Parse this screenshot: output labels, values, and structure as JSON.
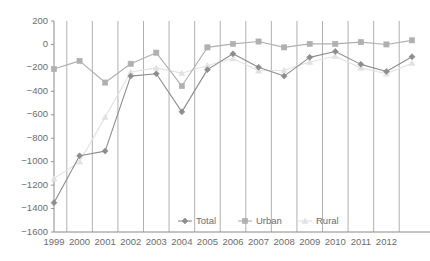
{
  "chart_data": {
    "type": "line",
    "title": "",
    "subtitle": "",
    "xlabel": "",
    "ylabel": "",
    "x": [
      1999,
      2000,
      2001,
      2002,
      2003,
      2004,
      2005,
      2006,
      2007,
      2008,
      2009,
      2010,
      2011,
      2012,
      2013
    ],
    "categories": [
      "1999",
      "2000",
      "2001",
      "2002",
      "2003",
      "2004",
      "2005",
      "2006",
      "2007",
      "2008",
      "2009",
      "2010",
      "2011",
      "2012",
      ""
    ],
    "xtick_labels": [
      "1999",
      "2000",
      "2001",
      "2002",
      "2003",
      "2004",
      "2005",
      "2006",
      "2007",
      "2008",
      "2009",
      "2010",
      "2011",
      "2012"
    ],
    "ytick_labels": [
      "200",
      "0",
      "-200",
      "-400",
      "-600",
      "-800",
      "-1000",
      "-1200",
      "-1400",
      "-1600"
    ],
    "yticks": [
      200,
      0,
      -200,
      -400,
      -600,
      -800,
      -1000,
      -1200,
      -1400,
      -1600
    ],
    "ylim": [
      -1600,
      200
    ],
    "xlim": [
      1999,
      2013
    ],
    "grid": "vertical-only",
    "legend_position": "inside-bottom-center",
    "series": [
      {
        "name": "Total",
        "color": "#8d8d8d",
        "marker": "diamond",
        "values": [
          -1350,
          -950,
          -910,
          -270,
          -250,
          -575,
          -215,
          -80,
          -195,
          -270,
          -110,
          -60,
          -170,
          -230,
          -105
        ]
      },
      {
        "name": "Urban",
        "color": "#b0b0b0",
        "marker": "square",
        "values": [
          -210,
          -140,
          -325,
          -165,
          -70,
          -355,
          -25,
          5,
          25,
          -25,
          5,
          5,
          20,
          0,
          35
        ]
      },
      {
        "name": "Rural",
        "color": "#e2e2e2",
        "marker": "triangle",
        "values": [
          -1145,
          -1000,
          -620,
          -235,
          -200,
          -245,
          -180,
          -120,
          -225,
          -220,
          -150,
          -100,
          -200,
          -250,
          -160
        ]
      }
    ]
  },
  "legend": {
    "items": [
      {
        "label": "Total"
      },
      {
        "label": "Urban"
      },
      {
        "label": "Rural"
      }
    ]
  },
  "colors": {
    "total": "#8d8d8d",
    "urban": "#b0b0b0",
    "rural": "#e2e2e2",
    "axis": "#8a8a8a",
    "gridline": "#a8a8a8",
    "text": "#6d6d6d",
    "background": "#ffffff"
  }
}
